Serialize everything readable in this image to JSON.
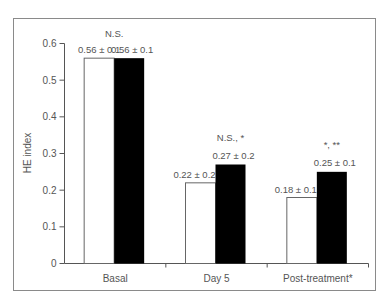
{
  "chart_data": {
    "type": "bar",
    "title": "",
    "xlabel": "",
    "ylabel": "HE index",
    "ylim": [
      0,
      0.6
    ],
    "yticks": [
      0,
      0.1,
      0.2,
      0.3,
      0.4,
      0.5,
      0.6
    ],
    "ytick_labels": [
      "0",
      "0.1",
      "0.2",
      "0.3",
      "0.4",
      "0.5",
      "0.6"
    ],
    "grid": false,
    "legend": null,
    "categories": [
      "Basal",
      "Day 5",
      "Post-treatment*"
    ],
    "series": [
      {
        "name": "white bars",
        "color": "#ffffff",
        "values": [
          0.56,
          0.22,
          0.18
        ],
        "labels": [
          "0.56 ± 0.1",
          "0.22 ± 0.2",
          "0.18 ± 0.1"
        ]
      },
      {
        "name": "black bars",
        "color": "#000000",
        "values": [
          0.56,
          0.27,
          0.25
        ],
        "labels": [
          "0.56 ± 0.1",
          "0.27 ± 0.2",
          "0.25 ± 0.1"
        ]
      }
    ],
    "annotations": [
      {
        "category": "Basal",
        "text": "N.S."
      },
      {
        "category": "Day 5",
        "text": "N.S., *"
      },
      {
        "category": "Post-treatment*",
        "text": "*, **"
      }
    ]
  }
}
